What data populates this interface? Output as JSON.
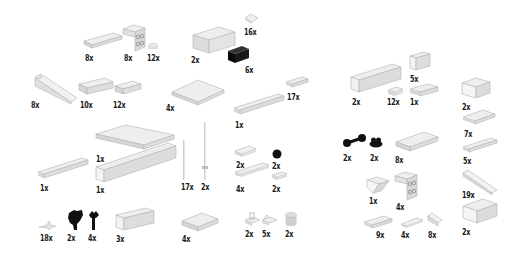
{
  "page": {
    "background": "#ffffff",
    "colors": {
      "light_part": "#e6e6e6",
      "light_edge": "#b4b4b4",
      "dark_part": "#111111",
      "text": "#1a1a1a"
    }
  },
  "parts": [
    {
      "id": "p1",
      "shape": "plate-1x4",
      "color": "light",
      "qty": "8x"
    },
    {
      "id": "p2",
      "shape": "bracket-2x2",
      "color": "light",
      "qty": "8x"
    },
    {
      "id": "p3",
      "shape": "round-plate-1x1",
      "color": "light",
      "qty": "12x"
    },
    {
      "id": "p4",
      "shape": "brick-2x4",
      "color": "light",
      "qty": "2x"
    },
    {
      "id": "p5",
      "shape": "tile-1x1",
      "color": "light",
      "qty": "16x"
    },
    {
      "id": "p6",
      "shape": "brick-1x2",
      "color": "dark",
      "qty": "6x"
    },
    {
      "id": "p7",
      "shape": "slope-long",
      "color": "light",
      "qty": "8x"
    },
    {
      "id": "p8",
      "shape": "plate-1x4",
      "color": "light",
      "qty": "10x"
    },
    {
      "id": "p9",
      "shape": "plate-1x2",
      "color": "light",
      "qty": "12x"
    },
    {
      "id": "p10",
      "shape": "plate-4x4",
      "color": "light",
      "qty": "4x"
    },
    {
      "id": "p11",
      "shape": "plate-1x2",
      "color": "light",
      "qty": "17x"
    },
    {
      "id": "p12",
      "shape": "plate-1x8",
      "color": "light",
      "qty": "1x"
    },
    {
      "id": "p13",
      "shape": "plate-6x8",
      "color": "light",
      "qty": "1x"
    },
    {
      "id": "p14",
      "shape": "plate-1x6",
      "color": "light",
      "qty": "1x"
    },
    {
      "id": "p15",
      "shape": "brick-1x12",
      "color": "light",
      "qty": "1x"
    },
    {
      "id": "p16",
      "shape": "bar",
      "color": "light",
      "qty": "17x"
    },
    {
      "id": "p17",
      "shape": "antenna",
      "color": "light",
      "qty": "2x"
    },
    {
      "id": "p18",
      "shape": "tile-1x2",
      "color": "light",
      "qty": "2x"
    },
    {
      "id": "p19",
      "shape": "round-dark",
      "color": "dark",
      "qty": "2x"
    },
    {
      "id": "p20",
      "shape": "tile-1x4",
      "color": "light",
      "qty": "4x"
    },
    {
      "id": "p21",
      "shape": "tile-1x2",
      "color": "light",
      "qty": "2x"
    },
    {
      "id": "p22",
      "shape": "clip-small",
      "color": "light",
      "qty": "18x"
    },
    {
      "id": "p23",
      "shape": "plant-dark",
      "color": "dark",
      "qty": "2x"
    },
    {
      "id": "p24",
      "shape": "flower-dark",
      "color": "dark",
      "qty": "4x"
    },
    {
      "id": "p25",
      "shape": "brick-1x4",
      "color": "light",
      "qty": "3x"
    },
    {
      "id": "p26",
      "shape": "plate-2x4",
      "color": "light",
      "qty": "4x"
    },
    {
      "id": "p27",
      "shape": "clip-plate",
      "color": "light",
      "qty": "2x"
    },
    {
      "id": "p28",
      "shape": "clip-plate",
      "color": "light",
      "qty": "5x"
    },
    {
      "id": "p29",
      "shape": "round-brick-1x1",
      "color": "light",
      "qty": "2x"
    },
    {
      "id": "p30",
      "shape": "brick-1x6",
      "color": "light",
      "qty": "2x"
    },
    {
      "id": "p31",
      "shape": "plate-1x1",
      "color": "light",
      "qty": "12x"
    },
    {
      "id": "p32",
      "shape": "brick-1x2",
      "color": "light",
      "qty": "5x"
    },
    {
      "id": "p33",
      "shape": "plate-1x2",
      "color": "light",
      "qty": "1x"
    },
    {
      "id": "p34",
      "shape": "brick-2x2",
      "color": "light",
      "qty": "2x"
    },
    {
      "id": "p35",
      "shape": "plate-2x3",
      "color": "light",
      "qty": "7x"
    },
    {
      "id": "p36",
      "shape": "plate-1x4",
      "color": "light",
      "qty": "5x"
    },
    {
      "id": "p37",
      "shape": "dumbbell-dark",
      "color": "dark",
      "qty": "2x"
    },
    {
      "id": "p38",
      "shape": "round-dark",
      "color": "dark",
      "qty": "2x"
    },
    {
      "id": "p39",
      "shape": "plate-2x4",
      "color": "light",
      "qty": "8x"
    },
    {
      "id": "p40",
      "shape": "slope-long",
      "color": "light",
      "qty": "19x"
    },
    {
      "id": "p41",
      "shape": "slope-inv",
      "color": "light",
      "qty": "1x"
    },
    {
      "id": "p42",
      "shape": "bracket-2x2",
      "color": "light",
      "qty": "4x"
    },
    {
      "id": "p43",
      "shape": "brick-2x3",
      "color": "light",
      "qty": "2x"
    },
    {
      "id": "p44",
      "shape": "plate-1x3",
      "color": "light",
      "qty": "9x"
    },
    {
      "id": "p45",
      "shape": "tile-1x3",
      "color": "light",
      "qty": "4x"
    },
    {
      "id": "p46",
      "shape": "slope-1x1",
      "color": "light",
      "qty": "8x"
    }
  ]
}
